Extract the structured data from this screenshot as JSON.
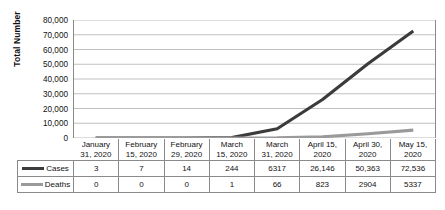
{
  "chart_data": {
    "type": "line",
    "title": "",
    "xlabel": "",
    "ylabel": "Total Number",
    "ylim": [
      0,
      80000
    ],
    "ytick_step": 10000,
    "yticks": [
      "80,000",
      "70,000",
      "60,000",
      "50,000",
      "40,000",
      "30,000",
      "20,000",
      "10,000",
      "0"
    ],
    "grid": true,
    "legend_position": "data-table-left",
    "categories": [
      "January 31, 2020",
      "February 15, 2020",
      "February 29, 2020",
      "March 15, 2020",
      "March 31, 2020",
      "April 15, 2020",
      "April 30, 2020",
      "May 15, 2020"
    ],
    "category_lines": [
      [
        "January",
        "31, 2020"
      ],
      [
        "February",
        "15, 2020"
      ],
      [
        "February",
        "29, 2020"
      ],
      [
        "March",
        "15, 2020"
      ],
      [
        "March",
        "31, 2020"
      ],
      [
        "April 15,",
        "2020"
      ],
      [
        "April 30,",
        "2020"
      ],
      [
        "May 15,",
        "2020"
      ]
    ],
    "series": [
      {
        "name": "Cases",
        "color": "#3b3b3b",
        "values": [
          3,
          7,
          14,
          244,
          6317,
          26146,
          50363,
          72536
        ],
        "labels": [
          "3",
          "7",
          "14",
          "244",
          "6317",
          "26,146",
          "50,363",
          "72,536"
        ]
      },
      {
        "name": "Deaths",
        "color": "#9a9a9a",
        "values": [
          0,
          0,
          0,
          1,
          66,
          823,
          2904,
          5337
        ],
        "labels": [
          "0",
          "0",
          "0",
          "1",
          "66",
          "823",
          "2904",
          "5337"
        ]
      }
    ]
  },
  "colors": {
    "cases": "#3b3b3b",
    "deaths": "#9a9a9a",
    "gridline": "#b9b9b9",
    "axis": "#8a8a8a",
    "table_border": "#8a8a8a",
    "background": "#ffffff",
    "text": "#111111"
  }
}
